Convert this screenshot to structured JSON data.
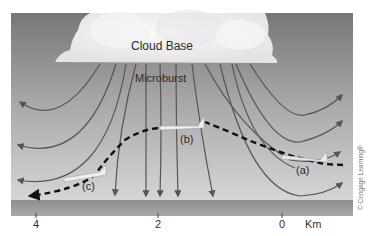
{
  "diagram": {
    "labels": {
      "cloud_base": "Cloud Base",
      "microburst": "Microburst",
      "plane_a": "(a)",
      "plane_b": "(b)",
      "plane_c": "(c)"
    },
    "axis": {
      "ticks": [
        "4",
        "2",
        "0"
      ],
      "unit": "Km"
    },
    "copyright": "© Cengage Learning®",
    "colors": {
      "sky_top": "#7b7b7b",
      "sky_bottom": "#d4d4d4",
      "cloud": "#f2f2f2",
      "arrows": "#5a5a5a",
      "flight_path": "#111111",
      "ground": "#9a9a9a"
    }
  }
}
